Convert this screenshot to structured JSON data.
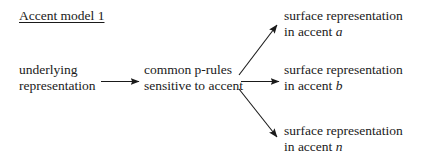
{
  "diagram": {
    "title": "Accent model 1",
    "background_color": "#ffffff",
    "ink_color": "#1a1a1a",
    "nodes": {
      "underlying": {
        "line1": "underlying",
        "line2": "representation"
      },
      "rules": {
        "line1": "common p-rules",
        "line2": "sensitive to accent"
      },
      "surface_a": {
        "line1": "surface representation",
        "line2_prefix": "in accent ",
        "line2_variable": "a"
      },
      "surface_b": {
        "line1": "surface representation",
        "line2_prefix": "in accent ",
        "line2_variable": "b"
      },
      "surface_n": {
        "line1": "surface representation",
        "line2_prefix": "in accent ",
        "line2_variable": "n"
      }
    },
    "arrows": [
      {
        "name": "arrow-underlying-to-rules",
        "direction": "right",
        "from": "underlying representation",
        "to": "common p-rules sensitive to accent"
      },
      {
        "name": "arrow-rules-to-surface-a",
        "direction": "up-right",
        "from": "common p-rules sensitive to accent",
        "to": "surface representation in accent a"
      },
      {
        "name": "arrow-rules-to-surface-b",
        "direction": "right",
        "from": "common p-rules sensitive to accent",
        "to": "surface representation in accent b"
      },
      {
        "name": "arrow-rules-to-surface-n",
        "direction": "down-right",
        "from": "common p-rules sensitive to accent",
        "to": "surface representation in accent n"
      }
    ]
  }
}
